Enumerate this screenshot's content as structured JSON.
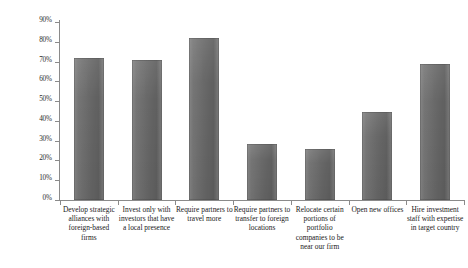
{
  "chart_data": {
    "type": "bar",
    "title": "",
    "subtitle": "",
    "xlabel": "",
    "ylabel": "",
    "ylim": [
      0,
      90
    ],
    "grid": false,
    "legend": null,
    "y_tick_labels": [
      "90%",
      "80%",
      "70%",
      "60%",
      "50%",
      "40%",
      "30%",
      "20%",
      "10%",
      "0%"
    ],
    "y_tick_values": [
      90,
      80,
      70,
      60,
      50,
      40,
      30,
      20,
      10,
      0
    ],
    "value_suffix": "%",
    "bar_color": "#6e6e6e",
    "axis_color": "#8a8a8a",
    "categories": [
      "Develop strategic alliances with foreign-based firms",
      "Invest only with investors that have a local presence",
      "Require partners to travel more",
      "Require partners to transfer to foreign locations",
      "Relocate certain portions of portfolio companies to be near our firm",
      "Open new offices",
      "Hire investment staff with expertise in target country"
    ],
    "values": [
      72,
      71,
      82,
      28.5,
      26,
      44.5,
      69
    ]
  }
}
